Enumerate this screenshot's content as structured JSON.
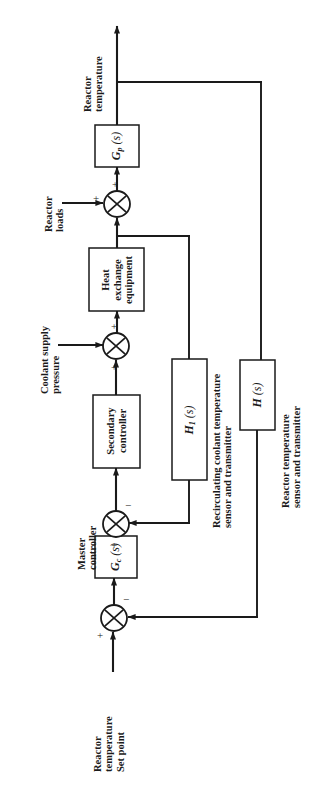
{
  "figure": {
    "type": "block-diagram",
    "orientation": "rotated-90-ccw",
    "width": 322,
    "height": 785,
    "line_color": "#1a1a1a",
    "background_color": "#ffffff"
  },
  "blocks": [
    {
      "id": "process",
      "label": "G_p (s)",
      "label_main": "G",
      "label_sub": "p",
      "label_arg": "(s)"
    },
    {
      "id": "heat-exchange-equipment",
      "label": "Heat exchange equipment",
      "line1": "Heat",
      "line2": "exchange",
      "line3": "equipment"
    },
    {
      "id": "secondary-controller",
      "label": "Secondary controller",
      "line1": "Secondary",
      "line2": "controller"
    },
    {
      "id": "master-controller",
      "label": "G_c (s)",
      "label_main": "G",
      "label_sub": "c",
      "label_arg": "(s)"
    },
    {
      "id": "inner-feedback",
      "label": "H_1 (s)",
      "label_main": "H",
      "label_sub": "1",
      "label_arg": "(s)"
    },
    {
      "id": "outer-feedback",
      "label": "H (s)",
      "label_main": "H",
      "label_sub": "",
      "label_arg": "(s)"
    }
  ],
  "labels": {
    "reactor_temperature_output": {
      "line1": "Reactor",
      "line2": "temperature"
    },
    "reactor_loads": {
      "line1": "Reactor",
      "line2": "loads"
    },
    "coolant_supply_pressure": {
      "line1": "Coolant supply",
      "line2": "pressure"
    },
    "master_controller_caption": {
      "line1": "Master",
      "line2": "controller"
    },
    "reactor_temperature_set_point": {
      "line1": "Reactor",
      "line2": "temperature",
      "line3": "Set point"
    },
    "inner_feedback_caption": {
      "line1": "Recirculating coolant temperature",
      "line2": "sensor and transmitter"
    },
    "outer_feedback_caption": {
      "line1": "Reactor temperature",
      "line2": "sensor and transmitter"
    }
  },
  "summing_junctions": [
    {
      "id": "load-summer",
      "signs": {
        "a": "+",
        "b": "+"
      }
    },
    {
      "id": "coolant-summer",
      "signs": {
        "a": "+",
        "b": "+"
      }
    },
    {
      "id": "secondary-summer",
      "signs": {
        "a": "+",
        "b": "−"
      }
    },
    {
      "id": "master-summer",
      "signs": {
        "a": "+",
        "b": "−"
      }
    }
  ]
}
